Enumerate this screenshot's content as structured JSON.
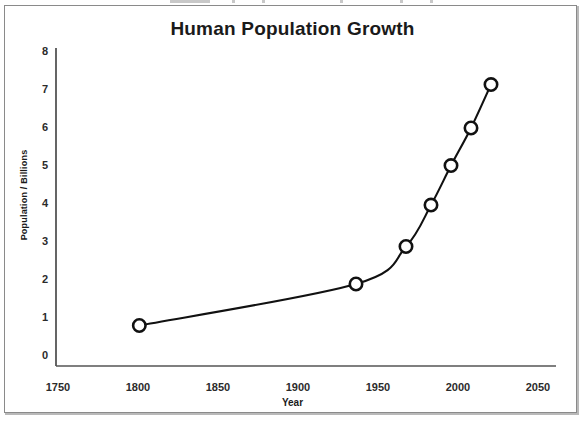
{
  "figure": {
    "title": "Human Population Growth",
    "background_color": "#ffffff",
    "frame_color": "#8a8a8a",
    "line_color": "#111111",
    "marker_fill": "#ffffff",
    "marker_edge_color": "#111111"
  },
  "axes": {
    "x_title": "Year",
    "y_title": "Population / Billions",
    "x_ticks": [
      "1750",
      "1800",
      "1850",
      "1900",
      "1950",
      "2000",
      "2050"
    ],
    "y_ticks": [
      "8",
      "7",
      "6",
      "5",
      "4",
      "3",
      "2",
      "1",
      "0"
    ]
  },
  "chart_data": {
    "type": "line",
    "title": "Human Population Growth",
    "xlabel": "Year",
    "ylabel": "Population / Billions",
    "xlim": [
      1750,
      2050
    ],
    "ylim": [
      0,
      8
    ],
    "xticks": [
      1750,
      1800,
      1850,
      1900,
      1950,
      2000,
      2050
    ],
    "yticks": [
      0,
      1,
      2,
      3,
      4,
      5,
      6,
      7,
      8
    ],
    "grid": false,
    "legend": false,
    "marker": "open-circle",
    "series": [
      {
        "name": "World population",
        "x": [
          1800,
          1930,
          1960,
          1975,
          1987,
          1999,
          2011
        ],
        "y": [
          1.0,
          2.05,
          3.0,
          4.05,
          5.05,
          6.0,
          7.1
        ]
      }
    ],
    "annotations": []
  }
}
